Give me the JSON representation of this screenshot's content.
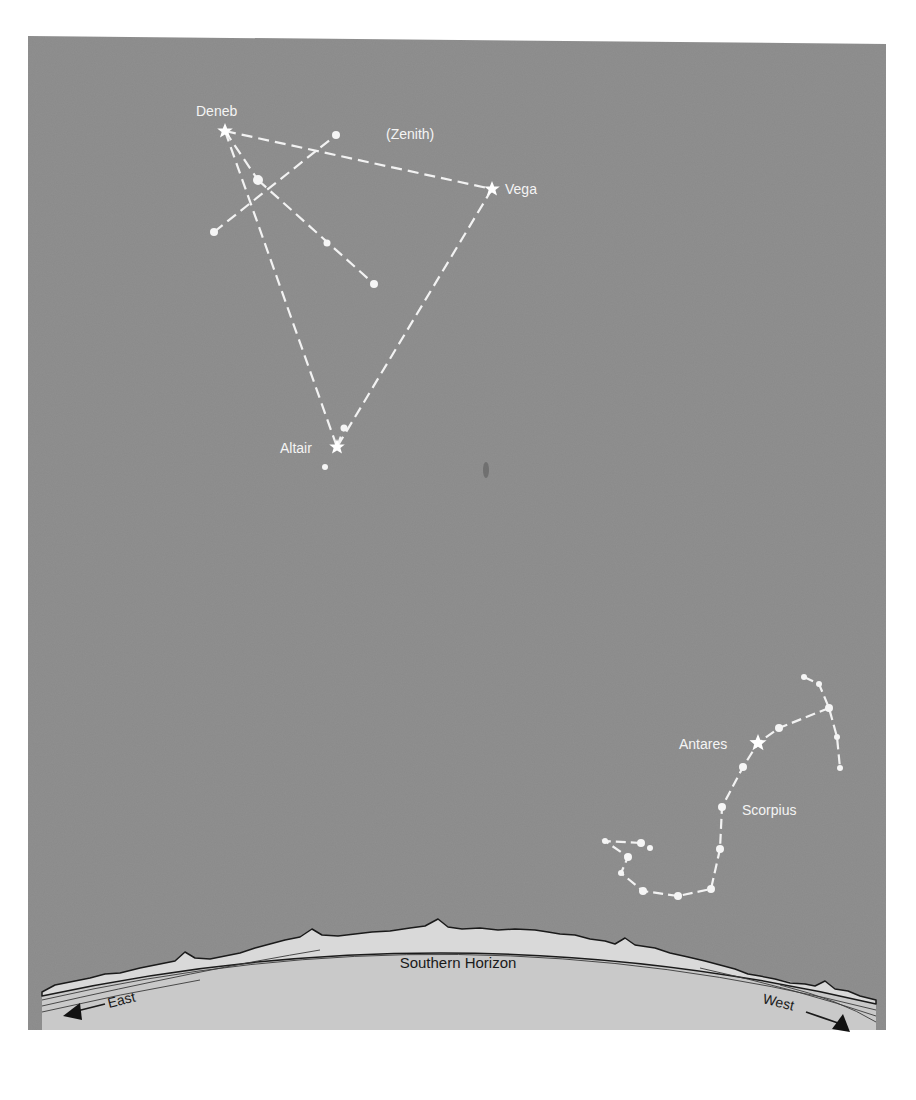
{
  "figure": {
    "sky_color": "#8a8a8a",
    "ground_color": "#c9c9c9",
    "line_color": "#f2f2f2",
    "ink_color": "#1a1a1a"
  },
  "labels": {
    "zenith": "(Zenith)",
    "deneb": "Deneb",
    "vega": "Vega",
    "altair": "Altair",
    "antares": "Antares",
    "scorpius": "Scorpius",
    "horizon": "Southern Horizon",
    "east": "East",
    "west": "West"
  },
  "stars": {
    "named": [
      {
        "name": "Deneb",
        "x": 225,
        "y": 131
      },
      {
        "name": "Vega",
        "x": 492,
        "y": 189
      },
      {
        "name": "Altair",
        "x": 337,
        "y": 447
      },
      {
        "name": "Antares",
        "x": 758,
        "y": 743
      }
    ],
    "cygnus_dots": [
      {
        "x": 336,
        "y": 135,
        "r": 4
      },
      {
        "x": 258,
        "y": 180,
        "r": 5
      },
      {
        "x": 214,
        "y": 232,
        "r": 4
      },
      {
        "x": 327,
        "y": 243,
        "r": 3.5
      },
      {
        "x": 374,
        "y": 284,
        "r": 4
      }
    ],
    "aquila_dots": [
      {
        "x": 344,
        "y": 428,
        "r": 3.5
      },
      {
        "x": 325,
        "y": 467,
        "r": 3
      }
    ],
    "scorpius_dots": [
      {
        "x": 804,
        "y": 677,
        "r": 3
      },
      {
        "x": 819,
        "y": 684,
        "r": 3
      },
      {
        "x": 829,
        "y": 708,
        "r": 4
      },
      {
        "x": 837,
        "y": 737,
        "r": 3
      },
      {
        "x": 840,
        "y": 768,
        "r": 3
      },
      {
        "x": 779,
        "y": 728,
        "r": 4
      },
      {
        "x": 743,
        "y": 767,
        "r": 4
      },
      {
        "x": 722,
        "y": 807,
        "r": 4
      },
      {
        "x": 720,
        "y": 849,
        "r": 4
      },
      {
        "x": 711,
        "y": 889,
        "r": 4
      },
      {
        "x": 678,
        "y": 896,
        "r": 4
      },
      {
        "x": 643,
        "y": 891,
        "r": 4
      },
      {
        "x": 621,
        "y": 873,
        "r": 3
      },
      {
        "x": 628,
        "y": 857,
        "r": 4
      },
      {
        "x": 641,
        "y": 843,
        "r": 4
      },
      {
        "x": 650,
        "y": 848,
        "r": 3
      },
      {
        "x": 605,
        "y": 841,
        "r": 3
      }
    ]
  }
}
